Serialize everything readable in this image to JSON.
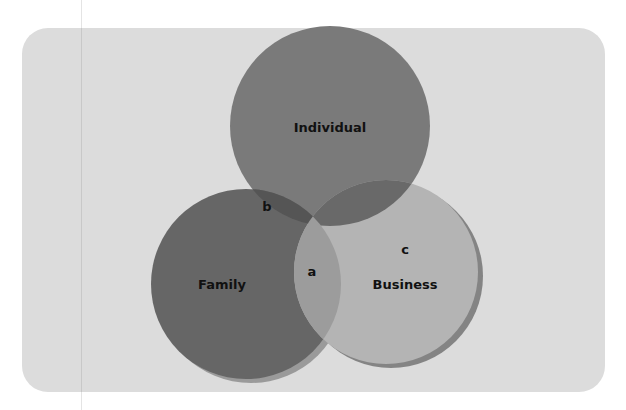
{
  "diagram": {
    "type": "venn",
    "sets": [
      {
        "id": "individual",
        "label": "Individual",
        "color": "#7a7a7a",
        "cx": 330,
        "cy": 126,
        "r": 100
      },
      {
        "id": "family",
        "label": "Family",
        "color": "#666666",
        "cx": 246,
        "cy": 284,
        "r": 95
      },
      {
        "id": "business",
        "label": "Business",
        "color": "#b4b4b4",
        "cx": 386,
        "cy": 272,
        "r": 92
      }
    ],
    "regions": [
      {
        "id": "a",
        "label": "a",
        "description": "Intersection of Individual, Family and Business"
      },
      {
        "id": "b",
        "label": "b",
        "description": "Intersection of Individual and Family"
      },
      {
        "id": "c",
        "label": "c",
        "description": "Business region"
      }
    ],
    "colors": {
      "panel": "#dcdcdc",
      "individual_family_overlap": "#555555",
      "individual_business_overlap": "#696969",
      "center_overlap": "#9c9c9c",
      "shadow": "#707070"
    }
  }
}
